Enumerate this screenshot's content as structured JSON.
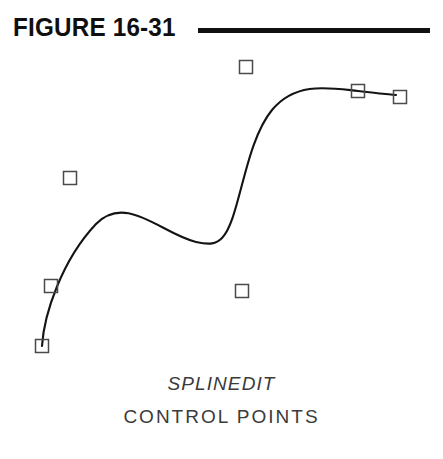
{
  "figure": {
    "title": "FIGURE 16-31",
    "rule_color": "#121111",
    "background_color": "#ffffff"
  },
  "caption": {
    "command": "SPLINEDIT",
    "subtitle": "CONTROL  POINTS"
  },
  "chart_data": {
    "type": "line",
    "title": "FIGURE 16-31",
    "subtitle": "SPLINEDIT CONTROL POINTS",
    "xlabel": "",
    "ylabel": "",
    "xlim": [
      0,
      443
    ],
    "ylim": [
      0,
      320
    ],
    "grid": false,
    "legend": null,
    "curve_color": "#141414",
    "curve_width": 2.1,
    "marker_color": "#4a4a4a",
    "marker_size": 13,
    "series": [
      {
        "name": "spline-curve",
        "type": "bezier-path",
        "path": "M 42 298 C 44 266, 62 212, 96 176 C 126 145, 162 186, 196 194 C 210 197, 216 196, 222 190 C 240 172, 244 96, 272 62 C 296 33, 330 40, 358 43 C 374 45, 386 46, 396 47"
      }
    ],
    "control_points": [
      {
        "index": 0,
        "x": 42,
        "y": 346,
        "on_curve": true,
        "label": "start-point"
      },
      {
        "index": 1,
        "x": 51,
        "y": 286,
        "on_curve": true,
        "label": "control-point-2"
      },
      {
        "index": 2,
        "x": 70,
        "y": 178,
        "on_curve": false,
        "label": "control-point-3"
      },
      {
        "index": 3,
        "x": 246,
        "y": 67,
        "on_curve": false,
        "label": "control-point-4"
      },
      {
        "index": 4,
        "x": 242,
        "y": 291,
        "on_curve": false,
        "label": "control-point-5"
      },
      {
        "index": 5,
        "x": 358,
        "y": 91,
        "on_curve": true,
        "label": "control-point-6"
      },
      {
        "index": 6,
        "x": 400,
        "y": 97,
        "on_curve": true,
        "label": "end-point"
      }
    ]
  }
}
